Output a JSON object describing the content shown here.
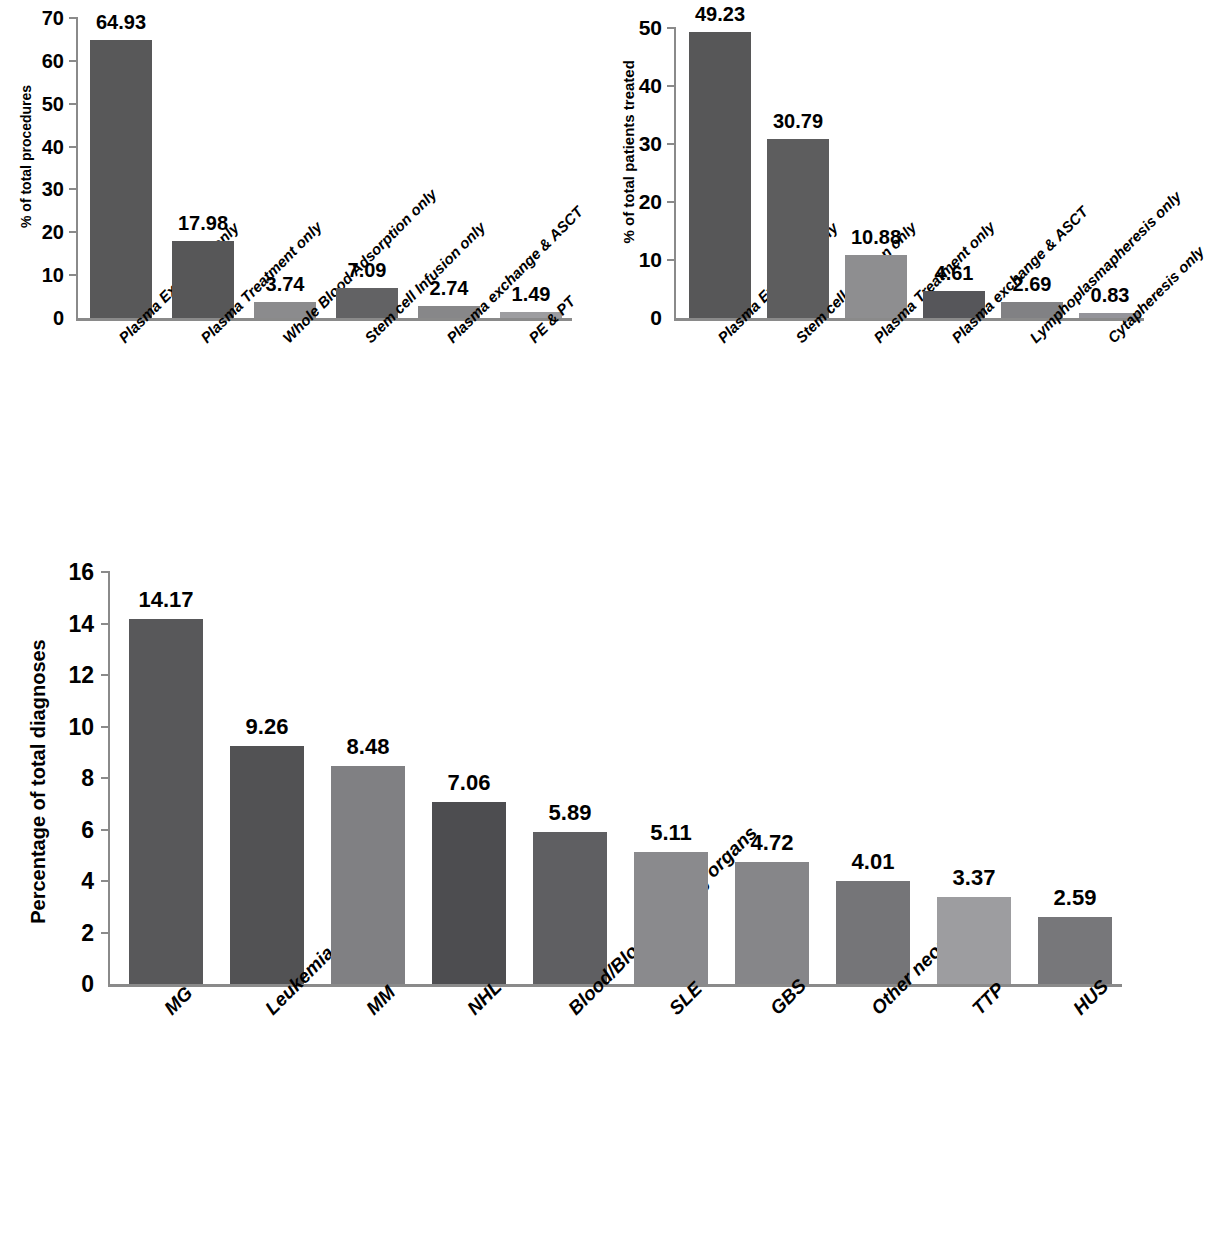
{
  "chart_data": [
    {
      "id": "chart1",
      "type": "bar",
      "title": "",
      "xlabel": "",
      "ylabel": "% of total procedures",
      "ylim": [
        0,
        70
      ],
      "yticks": [
        0,
        10,
        20,
        30,
        40,
        50,
        60,
        70
      ],
      "grid": false,
      "legend": "none",
      "categories": [
        "Plasma Exchange only",
        "Plasma Treatment only",
        "Whole Blood Adsorption only",
        "Stem cell Infusion only",
        "Plasma exchange & ASCT",
        "PE & PT"
      ],
      "values": [
        64.93,
        17.98,
        3.74,
        7.09,
        2.74,
        1.49
      ],
      "value_labels": [
        "64.93",
        "17.98",
        "3.74",
        "7.09",
        "2.74",
        "1.49"
      ],
      "bar_colors": [
        "#585859",
        "#575758",
        "#8b8b8d",
        "#626264",
        "#878789",
        "#9d9da0"
      ]
    },
    {
      "id": "chart2",
      "type": "bar",
      "title": "",
      "xlabel": "",
      "ylabel": "% of total patients treated",
      "ylim": [
        0,
        50
      ],
      "yticks": [
        0,
        10,
        20,
        30,
        40,
        50
      ],
      "grid": false,
      "legend": "none",
      "categories": [
        "Plasma Exchange only",
        "Stem cell infusion only",
        "Plasma Treatment only",
        "Plasma exchange & ASCT",
        "Lymphoplasmapheresis only",
        "Cytapheresis only"
      ],
      "values": [
        49.23,
        30.79,
        10.88,
        4.61,
        2.69,
        0.83
      ],
      "value_labels": [
        "49.23",
        "30.79",
        "10.88",
        "4.61",
        "2.69",
        "0.83"
      ],
      "bar_colors": [
        "#575758",
        "#5d5d5e",
        "#8e8e90",
        "#56565a",
        "#818184",
        "#94949a"
      ]
    },
    {
      "id": "chart3",
      "type": "bar",
      "title": "",
      "xlabel": "",
      "ylabel": "Percentage of total diagnoses",
      "ylim": [
        0,
        16
      ],
      "yticks": [
        0,
        2,
        4,
        6,
        8,
        10,
        12,
        14,
        16
      ],
      "grid": false,
      "legend": "none",
      "categories": [
        "MG",
        "Leukemia",
        "MM",
        "NHL",
        "Blood/Blood forming organs",
        "SLE",
        "GBS",
        "Other neoplasms",
        "TTP",
        "HUS"
      ],
      "values": [
        14.17,
        9.26,
        8.48,
        7.06,
        5.89,
        5.11,
        4.72,
        4.01,
        3.37,
        2.59
      ],
      "value_labels": [
        "14.17",
        "9.26",
        "8.48",
        "7.06",
        "5.89",
        "5.11",
        "4.72",
        "4.01",
        "3.37",
        "2.59"
      ],
      "bar_colors": [
        "#58585a",
        "#525254",
        "#808083",
        "#4d4d50",
        "#5f5f62",
        "#8a8a8d",
        "#868689",
        "#757578",
        "#9d9da0",
        "#77777a"
      ]
    }
  ]
}
